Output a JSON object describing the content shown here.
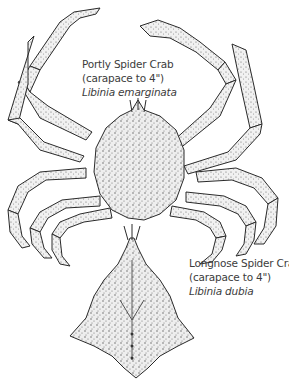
{
  "figure": {
    "species": [
      {
        "common_name": "Portly Spider Crab",
        "size_note": "(carapace to 4\")",
        "scientific_name": "Libinia emarginata",
        "view": "full body, dorsal, with legs and claws"
      },
      {
        "common_name": "Longnose Spider Crab",
        "size_note": "(carapace to 4\")",
        "scientific_name": "Libinia dubia",
        "view": "carapace only, dorsal"
      }
    ],
    "style": {
      "ink_color": "#2a2a2a",
      "shell_fill": "#ececec",
      "text_color": "#3c3c3c",
      "background": "#ffffff"
    }
  }
}
